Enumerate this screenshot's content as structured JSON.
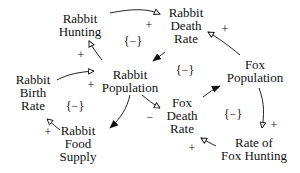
{
  "diagram": {
    "type": "causal-loop-diagram",
    "nodes": {
      "rabbit_hunting": [
        "Rabbit",
        "Hunting"
      ],
      "rabbit_death_rate": [
        "Rabbit",
        "Death",
        "Rate"
      ],
      "fox_population": [
        "Fox",
        "Population"
      ],
      "rabbit_population": [
        "Rabbit",
        "Population"
      ],
      "rabbit_birth_rate": [
        "Rabbit",
        "Birth",
        "Rate"
      ],
      "fox_death_rate": [
        "Fox",
        "Death",
        "Rate"
      ],
      "rabbit_food_supply": [
        "Rabbit",
        "Food",
        "Supply"
      ],
      "rate_of_fox_hunting": [
        "Rate of",
        "Fox Hunting"
      ]
    },
    "edges": [
      {
        "from": "Rabbit Hunting",
        "to": "Rabbit Death Rate",
        "sign": "+",
        "head": "open"
      },
      {
        "from": "Rabbit Population",
        "to": "Rabbit Hunting",
        "sign": "+",
        "head": "open"
      },
      {
        "from": "Fox Population",
        "to": "Rabbit Death Rate",
        "sign": "+",
        "head": "open"
      },
      {
        "from": "Rabbit Death Rate",
        "to": "Rabbit Population",
        "sign": "",
        "head": "filled"
      },
      {
        "from": "Rabbit Birth Rate",
        "to": "Rabbit Population",
        "sign": "+",
        "head": "open"
      },
      {
        "from": "Rabbit Population",
        "to": "Fox Death Rate",
        "sign": "−",
        "head": "open"
      },
      {
        "from": "Fox Death Rate",
        "to": "Fox Population",
        "sign": "",
        "head": "filled"
      },
      {
        "from": "Rabbit Population",
        "to": "Rabbit Food Supply",
        "sign": "",
        "head": "filled"
      },
      {
        "from": "Rabbit Food Supply",
        "to": "Rabbit Birth Rate",
        "sign": "+",
        "head": "open"
      },
      {
        "from": "Fox Population",
        "to": "Rate of Fox Hunting",
        "sign": "+",
        "head": "open"
      },
      {
        "from": "Rate of Fox Hunting",
        "to": "Fox Death Rate",
        "sign": "+",
        "head": "open"
      }
    ],
    "signs": {
      "plus": "+",
      "minus": "−"
    },
    "loop_label": "{−}"
  }
}
